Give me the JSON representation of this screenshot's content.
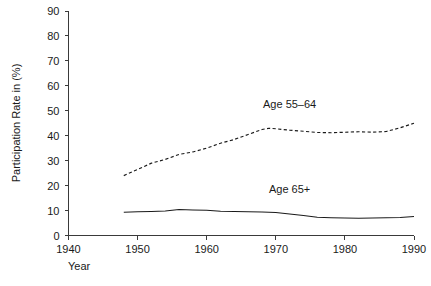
{
  "chart_data": {
    "type": "line",
    "title": "",
    "xlabel": "Year",
    "ylabel": "Participation Rate in (%)",
    "xlim": [
      1940,
      1990
    ],
    "ylim": [
      0,
      90
    ],
    "xticks": [
      1940,
      1950,
      1960,
      1970,
      1980,
      1990
    ],
    "yticks": [
      0,
      10,
      20,
      30,
      40,
      50,
      60,
      70,
      80,
      90
    ],
    "grid": false,
    "legend_position": "inline-annotations",
    "series": [
      {
        "name": "Age 55-64",
        "label": "Age 55–64",
        "style": "dashed",
        "x": [
          1948,
          1950,
          1952,
          1954,
          1956,
          1958,
          1960,
          1962,
          1964,
          1966,
          1968,
          1969,
          1970,
          1972,
          1974,
          1976,
          1978,
          1980,
          1982,
          1984,
          1986,
          1988,
          1990
        ],
        "values": [
          24.0,
          26.5,
          29.0,
          30.5,
          32.5,
          33.5,
          35.0,
          37.0,
          38.5,
          40.5,
          42.5,
          43.0,
          42.8,
          42.2,
          41.8,
          41.3,
          41.2,
          41.4,
          41.6,
          41.4,
          41.7,
          43.2,
          45.0
        ]
      },
      {
        "name": "Age 65+",
        "label": "Age 65+",
        "style": "solid",
        "x": [
          1948,
          1950,
          1952,
          1954,
          1956,
          1958,
          1960,
          1962,
          1964,
          1966,
          1968,
          1970,
          1972,
          1974,
          1976,
          1978,
          1980,
          1982,
          1984,
          1986,
          1988,
          1990
        ],
        "values": [
          9.3,
          9.5,
          9.6,
          9.8,
          10.4,
          10.2,
          10.1,
          9.7,
          9.6,
          9.5,
          9.4,
          9.2,
          8.6,
          8.0,
          7.3,
          7.1,
          7.0,
          6.9,
          7.0,
          7.1,
          7.2,
          7.6
        ]
      }
    ],
    "annotations": [
      {
        "text": "Age 55–64",
        "x": 1972,
        "y": 51
      },
      {
        "text": "Age 65+",
        "x": 1972,
        "y": 17
      }
    ]
  },
  "colors": {
    "line": "#1a1a1a",
    "axis": "#3a3a3a",
    "background": "#ffffff"
  }
}
